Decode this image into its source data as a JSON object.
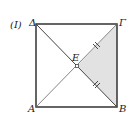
{
  "figure": {
    "label": "(I)",
    "points": {
      "A": "A",
      "B": "B",
      "Gamma": "Γ",
      "Delta": "Δ",
      "E": "E"
    },
    "shaded_region": "EΓB",
    "colors": {
      "shade": "#e2e2e2",
      "stroke": "#333333"
    }
  }
}
